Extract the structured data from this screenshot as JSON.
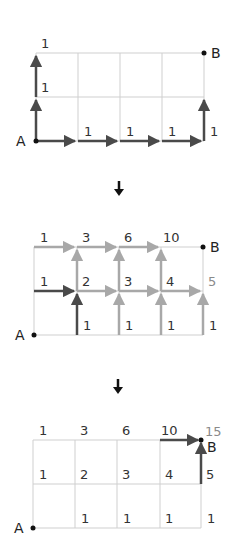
{
  "diagram": {
    "colors": {
      "grid": "#cfcfcf",
      "arrow_dark": "#4a4a4a",
      "arrow_light": "#a8a8a8",
      "label": "#333333",
      "label_light": "#8a8a8a",
      "step_arrow": "#111111"
    },
    "points": {
      "start": "A",
      "end": "B"
    },
    "panels": [
      {
        "id": "panel-1",
        "labels": {
          "top_left": "1",
          "mid_left": "1",
          "bottom_1": "1",
          "bottom_2": "1",
          "bottom_3": "1",
          "bottom_right": "1"
        }
      },
      {
        "id": "panel-2",
        "top_row": [
          "1",
          "3",
          "6",
          "10"
        ],
        "mid_row": [
          "1",
          "2",
          "3",
          "4",
          "5"
        ],
        "bottom_row": [
          "1",
          "1",
          "1",
          "1"
        ]
      },
      {
        "id": "panel-3",
        "top_row": [
          "1",
          "3",
          "6",
          "10"
        ],
        "result": "15",
        "mid_row": [
          "1",
          "2",
          "3",
          "4",
          "5"
        ],
        "bottom_row": [
          "1",
          "1",
          "1",
          "1"
        ]
      }
    ],
    "step_arrow_glyph": "down-arrow"
  }
}
